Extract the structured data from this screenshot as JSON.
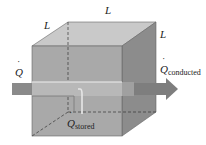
{
  "diagram": {
    "labels": {
      "edge_left": "L",
      "edge_top": "L",
      "edge_right": "L",
      "q_in": "Q",
      "q_conducted_main": "Q",
      "q_conducted_sub": "conducted",
      "q_stored_main": "Q",
      "q_stored_sub": "stored"
    },
    "colors": {
      "front_face": "#a9a9a9",
      "top_face": "#c9c9c9",
      "right_face": "#8c8c8c",
      "arrow": "#8a8a8a",
      "arrow_band": "#b8b8b8",
      "edges": "#555555"
    }
  }
}
